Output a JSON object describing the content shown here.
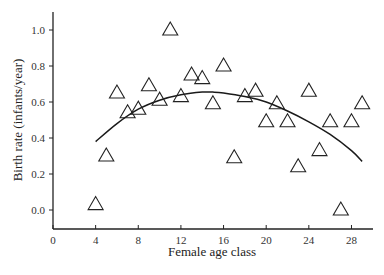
{
  "chart_data": {
    "type": "scatter",
    "title": "",
    "xlabel": "Female age class",
    "ylabel": "Birth rate (infants/year)",
    "xlim": [
      0,
      30
    ],
    "ylim": [
      -0.1,
      1.1
    ],
    "xticks": [
      0,
      4,
      8,
      12,
      16,
      20,
      24,
      28
    ],
    "yticks": [
      0.0,
      0.2,
      0.4,
      0.6,
      0.8,
      1.0
    ],
    "ytick_labels": [
      "0.0",
      "0.2",
      "0.4",
      "0.6",
      "0.8",
      "1.0"
    ],
    "grid": false,
    "legend": null,
    "series": [
      {
        "name": "Observed birth rate",
        "marker": "open-triangle",
        "points": [
          {
            "x": 4,
            "y": 0.03
          },
          {
            "x": 5,
            "y": 0.3
          },
          {
            "x": 6,
            "y": 0.65
          },
          {
            "x": 7,
            "y": 0.54
          },
          {
            "x": 8,
            "y": 0.56
          },
          {
            "x": 9,
            "y": 0.69
          },
          {
            "x": 10,
            "y": 0.61
          },
          {
            "x": 11,
            "y": 1.0
          },
          {
            "x": 12,
            "y": 0.63
          },
          {
            "x": 13,
            "y": 0.75
          },
          {
            "x": 14,
            "y": 0.73
          },
          {
            "x": 15,
            "y": 0.59
          },
          {
            "x": 16,
            "y": 0.8
          },
          {
            "x": 17,
            "y": 0.29
          },
          {
            "x": 18,
            "y": 0.63
          },
          {
            "x": 19,
            "y": 0.66
          },
          {
            "x": 20,
            "y": 0.49
          },
          {
            "x": 21,
            "y": 0.59
          },
          {
            "x": 22,
            "y": 0.49
          },
          {
            "x": 23,
            "y": 0.24
          },
          {
            "x": 24,
            "y": 0.66
          },
          {
            "x": 25,
            "y": 0.33
          },
          {
            "x": 26,
            "y": 0.49
          },
          {
            "x": 27,
            "y": 0.0
          },
          {
            "x": 28,
            "y": 0.49
          },
          {
            "x": 29,
            "y": 0.59
          }
        ]
      },
      {
        "name": "Fitted quadratic curve",
        "line": "solid",
        "points": [
          {
            "x": 4,
            "y": 0.38
          },
          {
            "x": 6,
            "y": 0.48
          },
          {
            "x": 8,
            "y": 0.56
          },
          {
            "x": 10,
            "y": 0.61
          },
          {
            "x": 12,
            "y": 0.64
          },
          {
            "x": 14,
            "y": 0.655
          },
          {
            "x": 15,
            "y": 0.655
          },
          {
            "x": 16,
            "y": 0.65
          },
          {
            "x": 18,
            "y": 0.63
          },
          {
            "x": 20,
            "y": 0.6
          },
          {
            "x": 22,
            "y": 0.55
          },
          {
            "x": 24,
            "y": 0.49
          },
          {
            "x": 26,
            "y": 0.42
          },
          {
            "x": 28,
            "y": 0.33
          },
          {
            "x": 29,
            "y": 0.27
          }
        ]
      }
    ]
  },
  "style": {
    "axis_color": "#222222",
    "marker_color": "#222222",
    "curve_color": "#1a1a1a"
  }
}
